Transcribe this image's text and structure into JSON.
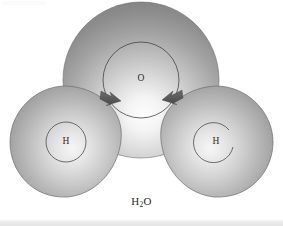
{
  "figure": {
    "formula": {
      "element_1": "H",
      "subscript": "2",
      "element_2": "O"
    },
    "background_color": "#ffffff",
    "outline_color": "#3c3c3c",
    "arrow_color": "#5a5a5a"
  },
  "atoms": [
    {
      "id": "oxygen",
      "label": "O",
      "role": "central-atom",
      "cx": 141,
      "cy": 80,
      "r": 78,
      "shell_r": 38,
      "highlight_color": "#fdfdfd",
      "shadow_color": "#6f6f6f"
    },
    {
      "id": "hydrogen-left",
      "label": "H",
      "role": "bonded-atom",
      "cx": 66,
      "cy": 142,
      "r": 56,
      "shell_r": 20,
      "highlight_color": "#f2f2f2",
      "shadow_color": "#777777"
    },
    {
      "id": "hydrogen-right",
      "label": "H",
      "role": "bonded-atom",
      "cx": 216,
      "cy": 142,
      "r": 56,
      "shell_r": 20,
      "highlight_color": "#f2f2f2",
      "shadow_color": "#777777"
    }
  ],
  "arrows": [
    {
      "id": "bond-arrow-left",
      "points_to": "oxygen",
      "direction": "up-right"
    },
    {
      "id": "bond-arrow-right",
      "points_to": "oxygen",
      "direction": "up-left"
    }
  ]
}
